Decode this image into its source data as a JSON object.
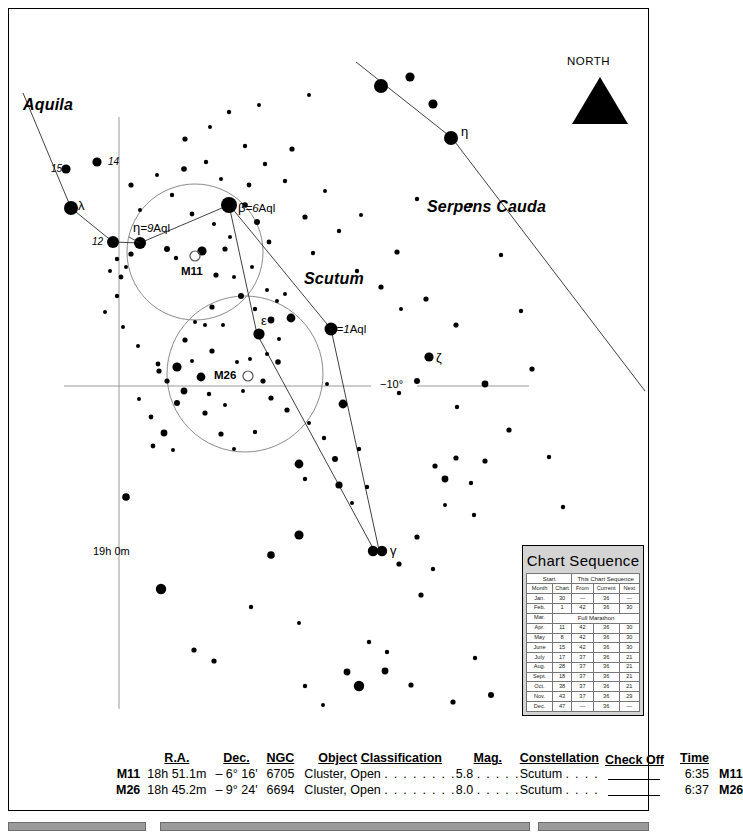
{
  "chart_data": {
    "type": "scatter",
    "xlabel": "Right Ascension",
    "ylabel": "Declination",
    "grid": true,
    "axis_lines": [
      {
        "label": "19h 0m",
        "orientation": "vertical"
      },
      {
        "label": "−10°",
        "orientation": "horizontal"
      }
    ],
    "constellations": [
      "Aquila",
      "Scutum",
      "Serpens Cauda"
    ],
    "deep_sky_objects": [
      {
        "name": "M11",
        "type": "open cluster"
      },
      {
        "name": "M26",
        "type": "open cluster"
      }
    ],
    "named_stars": [
      {
        "label": "λ",
        "constellation": "Aquila"
      },
      {
        "label": "η=9 Aql",
        "constellation": "Aquila"
      },
      {
        "label": "β=6 Aql",
        "constellation": "Aquila"
      },
      {
        "label": "α=1 Aql",
        "constellation": "Aquila"
      },
      {
        "label": "ε",
        "constellation": "Aquila"
      },
      {
        "label": "γ",
        "constellation": "Aquila"
      },
      {
        "label": "ζ",
        "constellation": "Aquila"
      },
      {
        "label": "η",
        "constellation": "Serpens Cauda"
      },
      {
        "label": "12",
        "constellation": "Aquila"
      },
      {
        "label": "14",
        "constellation": "Aquila"
      },
      {
        "label": "15",
        "constellation": "Aquila"
      }
    ],
    "compass": {
      "label": "NORTH",
      "direction": "up"
    }
  },
  "sky": {
    "constellation_labels": {
      "aquila": "Aquila",
      "scutum": "Scutum",
      "serpens_cauda": "Serpens Cauda"
    },
    "star_labels": {
      "lambda": "λ",
      "flam_12": "12",
      "flam_14": "14",
      "flam_15": "15",
      "eta_aql_greek": "η",
      "eta_aql_eq": "=9",
      "eta_aql_aql": "Aql",
      "beta_greek": "β",
      "beta_eq": "=6",
      "beta_aql": "Aql",
      "alpha_greek": "α",
      "alpha_eq": "=1",
      "alpha_aql": "Aql",
      "epsilon": "ε",
      "gamma": "γ",
      "zeta": "ζ",
      "eta_ser": "η"
    },
    "messier_labels": {
      "m11": "M11",
      "m26": "M26"
    },
    "coordinates": {
      "ra_line": "19h 0m",
      "dec_line": "−10°"
    },
    "compass_label": "NORTH"
  },
  "chart_sequence": {
    "title": "Chart  Sequence",
    "group_headers": {
      "start": "Start",
      "this_chart_sequence": "This Chart Sequence"
    },
    "columns": [
      "Month",
      "Chart",
      "From",
      "Current",
      "Next"
    ],
    "marathon_label": "Full  Marathon",
    "rows": [
      {
        "month": "Jan.",
        "chart": "30",
        "from": "—",
        "current": "36",
        "next": "—"
      },
      {
        "month": "Feb.",
        "chart": "1",
        "from": "42",
        "current": "36",
        "next": "30"
      },
      {
        "month": "Mar.",
        "marathon": true
      },
      {
        "month": "Apr.",
        "chart": "11",
        "from": "42",
        "current": "36",
        "next": "30"
      },
      {
        "month": "May",
        "chart": "8",
        "from": "42",
        "current": "36",
        "next": "30"
      },
      {
        "month": "June",
        "chart": "15",
        "from": "42",
        "current": "36",
        "next": "30"
      },
      {
        "month": "July",
        "chart": "17",
        "from": "37",
        "current": "36",
        "next": "21"
      },
      {
        "month": "Aug.",
        "chart": "28",
        "from": "37",
        "current": "36",
        "next": "21"
      },
      {
        "month": "Sept.",
        "chart": "18",
        "from": "37",
        "current": "36",
        "next": "21"
      },
      {
        "month": "Oct.",
        "chart": "38",
        "from": "37",
        "current": "36",
        "next": "21"
      },
      {
        "month": "Nov.",
        "chart": "43",
        "from": "37",
        "current": "36",
        "next": "29"
      },
      {
        "month": "Dec.",
        "chart": "47",
        "from": "—",
        "current": "36",
        "next": "—"
      }
    ]
  },
  "object_table": {
    "headers": {
      "ra": "R.A.",
      "dec": "Dec.",
      "ngc": "NGC",
      "object": "Object",
      "classification": "Classification",
      "mag": "Mag.",
      "constellation": "Constellation",
      "check_off": "Check Off",
      "time": "Time"
    },
    "rows": [
      {
        "m": "M11",
        "ra": "18h 51.1m",
        "dec": "–  6° 16'",
        "ngc": "6705",
        "object": "Cluster, Open",
        "dots1": ". . . . . . . .",
        "mag": "5.8",
        "dots2": ". . . . .",
        "constellation": "Scutum",
        "dots3": ". . . .",
        "time": "6:35",
        "m_end": "M11"
      },
      {
        "m": "M26",
        "ra": "18h 45.2m",
        "dec": "–  9° 24'",
        "ngc": "6694",
        "object": "Cluster, Open",
        "dots1": ". . . . . . . .",
        "mag": "8.0",
        "dots2": ". . . . .",
        "constellation": "Scutum",
        "dots3": ". . . .",
        "time": "6:37",
        "m_end": "M26"
      }
    ]
  },
  "colors": {
    "ink": "#000000",
    "grid": "#9a9a9a",
    "circle": "#8c8c8c",
    "panel": "#d4d4d4"
  }
}
